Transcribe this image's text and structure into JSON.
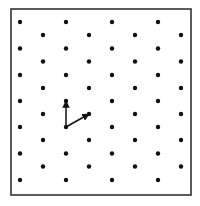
{
  "diagram": {
    "frame": {
      "x": 11,
      "y": 9,
      "width": 180,
      "height": 186,
      "stroke": "#333333",
      "stroke_width": 1.6
    },
    "lattice": {
      "color": "#111111",
      "dot_radius": 2.2,
      "rows_a": {
        "xs": [
          20,
          66,
          112,
          158
        ],
        "ys": [
          22,
          48.5,
          75,
          101,
          127,
          153.5,
          180
        ]
      },
      "rows_b": {
        "xs": [
          43,
          89,
          135,
          181
        ],
        "ys": [
          35,
          61.5,
          88,
          114,
          140,
          166.5
        ]
      }
    },
    "vectors": [
      {
        "name": "vector-a1",
        "from": [
          66,
          127
        ],
        "to": [
          66,
          101
        ],
        "color": "#111111"
      },
      {
        "name": "vector-a2",
        "from": [
          66,
          127
        ],
        "to": [
          89,
          114
        ],
        "color": "#111111"
      }
    ]
  }
}
